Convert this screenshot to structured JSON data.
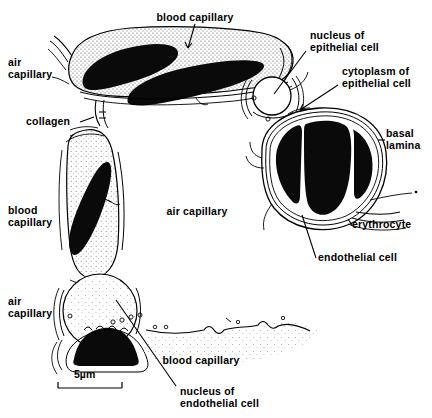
{
  "figure": {
    "title_alt": "Avian lung blood-gas barrier diagram",
    "background_color": "#ffffff",
    "ink_color": "#000000",
    "stipple_color": "#6a6a6a"
  },
  "labels": {
    "blood_capillary_top": "blood capillary",
    "air_capillary_topleft": "air\ncapillary",
    "collagen": "collagen",
    "nucleus_of_epithelial_cell": "nucleus of\nepithelial cell",
    "cytoplasm_of_epithelial_cell": "cytoplasm of\nepithelial cell",
    "basal_lamina": "basal\nlamina",
    "erythrocyte": "erythrocyte",
    "endothelial_cell": "endothelial cell",
    "blood_capillary_left": "blood\ncapillary",
    "air_capillary_center": "air capillary",
    "air_capillary_bottomleft": "air\ncapillary",
    "blood_capillary_bottom": "blood capillary",
    "nucleus_of_endothelial_cell": "nucleus of\nendothelial cell"
  },
  "scale_bar": {
    "text": "5µm",
    "length_px": 64,
    "value": 5,
    "unit": "µm"
  },
  "structures": {
    "erythrocytes_top_band": 2,
    "erythrocytes_right_cluster": 3,
    "erythrocyte_left_capillary": 1,
    "erythrocyte_bottom_left": 1,
    "nuclei_shown": 2
  }
}
